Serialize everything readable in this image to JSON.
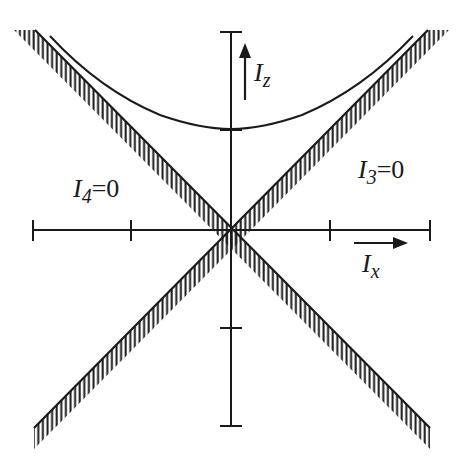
{
  "diagram": {
    "colors": {
      "ink": "#1a1a1a",
      "background": "#ffffff"
    },
    "axes": {
      "origin": [
        231,
        230
      ],
      "horizontal": {
        "x_start": 33,
        "x_end": 430,
        "ticks_x": [
          33,
          131,
          330,
          430
        ]
      },
      "vertical": {
        "y_start": 32,
        "y_end": 426,
        "ticks_y": [
          32,
          130,
          328,
          426
        ]
      }
    },
    "arrows": {
      "iz": {
        "label_main": "I",
        "label_sub": "z",
        "x": 245,
        "y_from": 100,
        "y_to": 44
      },
      "ix": {
        "label_main": "I",
        "label_sub": "x",
        "y": 243,
        "x_from": 354,
        "x_to": 407
      }
    },
    "labels": {
      "i4": {
        "main": "I",
        "sub": "4",
        "rest": "=0"
      },
      "i3": {
        "main": "I",
        "sub": "3",
        "rest": "=0"
      }
    },
    "curve": {
      "type": "hyperbola",
      "vertex": [
        231,
        129
      ],
      "left_end": [
        50,
        36
      ],
      "right_end": [
        413,
        36
      ]
    },
    "hatched_bands": [
      {
        "name": "I4=0 boundary",
        "from": [
          35,
          30
        ],
        "to": [
          430,
          428
        ],
        "hatch_side": "below"
      },
      {
        "name": "I3=0 boundary",
        "from": [
          428,
          30
        ],
        "to": [
          34,
          428
        ],
        "hatch_side": "below"
      }
    ]
  }
}
